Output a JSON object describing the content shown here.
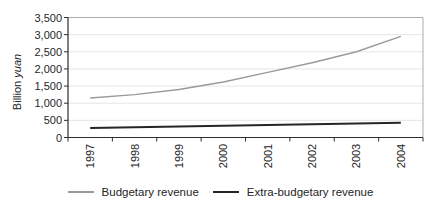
{
  "chart_data": {
    "type": "line",
    "categories": [
      "1997",
      "1998",
      "1999",
      "2000",
      "2001",
      "2002",
      "2003",
      "2004"
    ],
    "series": [
      {
        "name": "Budgetary revenue",
        "color": "#9a9a9a",
        "stroke_width": 1.4,
        "values": [
          1150,
          1250,
          1400,
          1620,
          1900,
          2180,
          2500,
          2950
        ]
      },
      {
        "name": "Extra-budgetary revenue",
        "color": "#262626",
        "stroke_width": 2,
        "values": [
          280,
          300,
          320,
          340,
          365,
          390,
          410,
          430
        ]
      }
    ],
    "title": "",
    "xlabel": "",
    "ylabel": "Billion yuan",
    "ylabel_main": "Billion",
    "ylabel_unit": "yuan",
    "ylim": [
      0,
      3500
    ],
    "ytick_step": 500,
    "yticks": [
      "0",
      "500",
      "1,000",
      "1,500",
      "2,000",
      "2,500",
      "3,000",
      "3,500"
    ],
    "grid": true,
    "legend_position": "bottom"
  },
  "colors": {
    "background": "#ffffff",
    "axis": "#2e2e2e",
    "grid": "#e6e6e6",
    "plot_border": "#ababab",
    "text": "#262626"
  }
}
